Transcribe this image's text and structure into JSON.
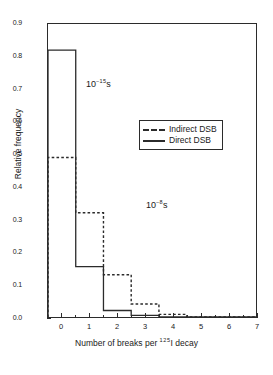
{
  "chart_data": {
    "type": "bar",
    "title": "",
    "xlabel": "Number of breaks per 125I decay",
    "xlabel_prefix": "Number of breaks per ",
    "xlabel_isotope_mass": "125",
    "xlabel_suffix": "I decay",
    "ylabel": "Relative frequency",
    "xlim": [
      -0.5,
      7
    ],
    "ylim": [
      0.0,
      0.9
    ],
    "grid": false,
    "legend_position": "upper right",
    "categories": [
      0,
      1,
      2,
      3,
      4,
      5,
      6
    ],
    "xticks": [
      "0",
      "1",
      "2",
      "3",
      "4",
      "5",
      "6",
      "7"
    ],
    "xtick_values": [
      0,
      1,
      2,
      3,
      4,
      5,
      6,
      7
    ],
    "yticks": [
      "0.0",
      "0.1",
      "0.2",
      "0.3",
      "0.4",
      "0.5",
      "0.6",
      "0.7",
      "0.8",
      "0.9"
    ],
    "ytick_values": [
      0.0,
      0.1,
      0.2,
      0.3,
      0.4,
      0.5,
      0.6,
      0.7,
      0.8,
      0.9
    ],
    "series": [
      {
        "name": "Indirect DSB",
        "style": "dashed",
        "color": "#2b2b2b",
        "annotation": "10-8s",
        "values": [
          0.49,
          0.32,
          0.13,
          0.04,
          0.008,
          0.0,
          0.0
        ]
      },
      {
        "name": "Direct DSB",
        "style": "solid",
        "color": "#2b2b2b",
        "annotation": "10-15s",
        "values": [
          0.82,
          0.155,
          0.02,
          0.005,
          0.0,
          0.0,
          0.0
        ]
      }
    ],
    "annotations": [
      {
        "id": "direct",
        "base": "10",
        "exponent": "-15",
        "unit": "s",
        "x_px": 86,
        "y_px": 78
      },
      {
        "id": "indirect",
        "base": "10",
        "exponent": "-8",
        "unit": "s",
        "x_px": 146,
        "y_px": 199
      }
    ]
  },
  "legend": {
    "entries": [
      {
        "label": "Indirect DSB",
        "style": "dashed"
      },
      {
        "label": "Direct DSB",
        "style": "solid"
      }
    ]
  }
}
